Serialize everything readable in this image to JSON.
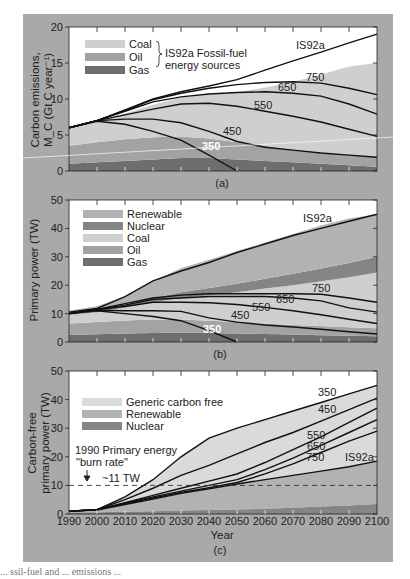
{
  "colors": {
    "figure_bg": "#a9a9a9",
    "coal": "#cfcfcf",
    "oil": "#a3a3a3",
    "gas": "#6e6e6e",
    "renewable": "#b2b2b2",
    "nuclear": "#858585",
    "generic_carbon_free": "#dadada",
    "curve": "#111111"
  },
  "chart_data": [
    {
      "panel": "(a)",
      "type": "area",
      "title": "",
      "xlabel": "",
      "ylabel": "Carbon emissions, M_C (Gt C year^-1)",
      "ylabel_line1": "Carbon emissions,",
      "ylabel_line2": "M_C (Gt C year⁻¹)",
      "xlim": [
        1990,
        2100
      ],
      "ylim": [
        0,
        20
      ],
      "yticks": [
        0,
        5,
        10,
        15,
        20
      ],
      "x": [
        1990,
        2000,
        2010,
        2020,
        2030,
        2040,
        2050,
        2060,
        2070,
        2080,
        2090,
        2100
      ],
      "legend": {
        "entries": [
          "Coal",
          "Oil",
          "Gas"
        ],
        "group_label_line1": "IS92a Fossil-fuel",
        "group_label_line2": "energy sources",
        "position": "upper left"
      },
      "stacked_areas": [
        {
          "name": "Gas",
          "values": [
            1.0,
            1.2,
            1.4,
            1.6,
            1.8,
            1.8,
            1.6,
            1.4,
            1.2,
            1.0,
            0.8,
            0.6
          ]
        },
        {
          "name": "Oil",
          "values": [
            2.5,
            2.8,
            3.0,
            3.1,
            3.0,
            2.7,
            2.4,
            2.1,
            1.8,
            1.6,
            1.4,
            1.3
          ]
        },
        {
          "name": "Coal",
          "values": [
            2.5,
            3.0,
            3.6,
            4.5,
            5.4,
            6.1,
            6.9,
            8.1,
            9.4,
            10.8,
            12.3,
            13.1
          ]
        }
      ],
      "series": [
        {
          "name": "IS92a",
          "values": [
            6.0,
            7.0,
            8.5,
            10.0,
            11.0,
            11.8,
            12.7,
            14.0,
            15.3,
            16.5,
            17.8,
            19.0
          ]
        },
        {
          "name": "750",
          "values": [
            6.0,
            7.0,
            8.4,
            9.9,
            10.8,
            11.5,
            12.0,
            12.3,
            12.4,
            12.2,
            11.5,
            10.6
          ]
        },
        {
          "name": "650",
          "values": [
            6.0,
            7.0,
            8.3,
            9.6,
            10.3,
            10.7,
            10.9,
            11.0,
            10.8,
            10.4,
            9.3,
            7.9
          ]
        },
        {
          "name": "550",
          "values": [
            6.0,
            7.0,
            7.8,
            8.6,
            9.3,
            9.4,
            9.0,
            8.3,
            7.6,
            6.8,
            5.8,
            4.8
          ]
        },
        {
          "name": "450",
          "values": [
            6.0,
            7.0,
            7.2,
            7.2,
            6.7,
            5.5,
            4.1,
            3.3,
            2.9,
            2.5,
            2.2,
            1.9
          ]
        },
        {
          "name": "350",
          "values": [
            6.0,
            6.9,
            6.5,
            5.5,
            4.3,
            2.2,
            0.0
          ]
        }
      ],
      "annotations": [
        "IS92a",
        "750",
        "650",
        "550",
        "450",
        "350"
      ]
    },
    {
      "panel": "(b)",
      "type": "area",
      "title": "",
      "xlabel": "",
      "ylabel": "Primary power (TW)",
      "xlim": [
        1990,
        2100
      ],
      "ylim": [
        0,
        50
      ],
      "yticks": [
        0,
        10,
        20,
        30,
        40,
        50
      ],
      "x": [
        1990,
        2000,
        2010,
        2020,
        2030,
        2040,
        2050,
        2060,
        2070,
        2080,
        2090,
        2100
      ],
      "legend": {
        "entries": [
          "Renewable",
          "Nuclear",
          "Coal",
          "Oil",
          "Gas"
        ],
        "position": "upper left"
      },
      "stacked_areas": [
        {
          "name": "Gas",
          "values": [
            2.5,
            2.7,
            3.0,
            3.2,
            3.3,
            3.2,
            3.0,
            2.8,
            2.6,
            2.4,
            2.2,
            2.0
          ]
        },
        {
          "name": "Oil",
          "values": [
            4.0,
            4.3,
            4.6,
            4.7,
            4.6,
            4.3,
            4.0,
            3.7,
            3.4,
            3.2,
            3.0,
            2.8
          ]
        },
        {
          "name": "Coal",
          "values": [
            3.0,
            3.5,
            4.6,
            6.1,
            7.6,
            9.0,
            10.5,
            12.3,
            14.0,
            15.8,
            17.6,
            19.7
          ]
        },
        {
          "name": "Nuclear",
          "values": [
            0.5,
            0.6,
            1.0,
            1.5,
            2.0,
            2.5,
            3.0,
            3.5,
            4.0,
            4.5,
            5.0,
            5.5
          ]
        },
        {
          "name": "Renewable",
          "values": [
            1.0,
            1.5,
            2.8,
            6.0,
            8.5,
            10.0,
            11.5,
            12.7,
            14.0,
            15.1,
            15.7,
            15.0
          ]
        }
      ],
      "series": [
        {
          "name": "IS92a",
          "values": [
            10.5,
            11.8,
            16.0,
            21.5,
            25.0,
            28.0,
            31.5,
            34.5,
            37.5,
            40.0,
            42.5,
            45.0
          ]
        },
        {
          "name": "750",
          "values": [
            10.0,
            11.5,
            13.5,
            15.5,
            16.5,
            17.0,
            17.0,
            17.0,
            17.0,
            16.8,
            15.5,
            14.0
          ]
        },
        {
          "name": "650",
          "values": [
            10.0,
            11.5,
            13.0,
            15.0,
            15.5,
            16.0,
            16.0,
            16.0,
            15.5,
            14.5,
            12.0,
            10.5
          ]
        },
        {
          "name": "550",
          "values": [
            10.0,
            11.4,
            12.5,
            14.0,
            14.0,
            13.8,
            13.2,
            12.2,
            11.0,
            9.6,
            8.0,
            6.5
          ]
        },
        {
          "name": "450",
          "values": [
            10.0,
            11.2,
            11.0,
            11.0,
            10.8,
            8.5,
            7.0,
            6.0,
            5.3,
            4.5,
            3.6,
            2.8
          ]
        },
        {
          "name": "350",
          "values": [
            10.0,
            11.0,
            10.0,
            9.0,
            7.5,
            4.0,
            0.0
          ]
        }
      ],
      "annotations": [
        "IS92a",
        "750",
        "650",
        "550",
        "450",
        "350"
      ]
    },
    {
      "panel": "(c)",
      "type": "area",
      "title": "",
      "xlabel": "Year",
      "ylabel": "Carbon-free primary power (TW)",
      "ylabel_line1": "Carbon-free",
      "ylabel_line2": "primary power (TW)",
      "xlim": [
        1990,
        2100
      ],
      "ylim": [
        0,
        50
      ],
      "yticks": [
        0,
        10,
        20,
        30,
        40,
        50
      ],
      "xticks": [
        1990,
        2000,
        2010,
        2020,
        2030,
        2040,
        2050,
        2060,
        2070,
        2080,
        2090,
        2100
      ],
      "x": [
        1990,
        2000,
        2010,
        2020,
        2030,
        2040,
        2050,
        2060,
        2070,
        2080,
        2090,
        2100
      ],
      "legend": {
        "entries": [
          "Generic carbon free",
          "Renewable",
          "Nuclear"
        ],
        "position": "upper left"
      },
      "stacked_areas": [
        {
          "name": "Nuclear",
          "values": [
            0.5,
            0.6,
            0.8,
            1.0,
            1.2,
            1.4,
            1.6,
            1.8,
            2.2,
            2.6,
            3.0,
            3.5
          ]
        },
        {
          "name": "Renewable",
          "values": [
            0.5,
            0.9,
            2.5,
            4.2,
            6.0,
            7.4,
            8.9,
            10.2,
            11.3,
            12.4,
            13.5,
            15.0
          ]
        }
      ],
      "series": [
        {
          "name": "350",
          "values": [
            1.0,
            1.5,
            6.0,
            12.0,
            20.0,
            26.5,
            30.0,
            33.0,
            36.0,
            39.0,
            42.0,
            45.0
          ]
        },
        {
          "name": "450",
          "values": [
            1.0,
            1.5,
            5.0,
            9.0,
            13.5,
            17.0,
            21.0,
            25.0,
            28.5,
            32.5,
            36.5,
            40.5
          ]
        },
        {
          "name": "550",
          "values": [
            1.0,
            1.5,
            4.0,
            6.5,
            9.0,
            11.5,
            14.0,
            18.0,
            22.5,
            27.0,
            32.0,
            37.0
          ]
        },
        {
          "name": "650",
          "values": [
            1.0,
            1.5,
            3.8,
            6.0,
            8.0,
            10.0,
            12.0,
            15.5,
            19.5,
            24.0,
            28.5,
            33.0
          ]
        },
        {
          "name": "750",
          "values": [
            1.0,
            1.5,
            3.6,
            5.6,
            7.5,
            9.2,
            11.0,
            14.0,
            17.5,
            21.5,
            25.5,
            29.0
          ]
        },
        {
          "name": "IS92a",
          "values": [
            1.0,
            1.4,
            3.3,
            5.2,
            7.2,
            8.8,
            10.5,
            12.0,
            13.5,
            15.0,
            16.5,
            18.5
          ]
        }
      ],
      "reference_line": {
        "label_line1": "1990 Primary energy",
        "label_line2": "\"burn rate\"",
        "value_label": "~11 TW",
        "y": 10,
        "style": "dashed"
      },
      "annotations": [
        "350",
        "450",
        "550",
        "650",
        "750",
        "IS92a",
        "1990 Primary energy \"burn rate\"",
        "~11 TW"
      ]
    }
  ],
  "panel_labels": [
    "(a)",
    "(b)",
    "(c)"
  ],
  "footer_text": "... ssil-fuel and ... emissions ... "
}
